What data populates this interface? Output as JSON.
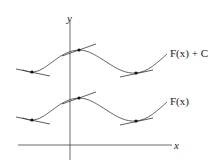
{
  "axes": {
    "x_label": "x",
    "y_label": "y"
  },
  "curves": [
    {
      "name": "upper",
      "label": "F(x) + C"
    },
    {
      "name": "lower",
      "label": "F(x)"
    }
  ],
  "colors": {
    "curve": "#555555",
    "axis": "#444444",
    "tangent": "#333333",
    "point": "#111111"
  }
}
